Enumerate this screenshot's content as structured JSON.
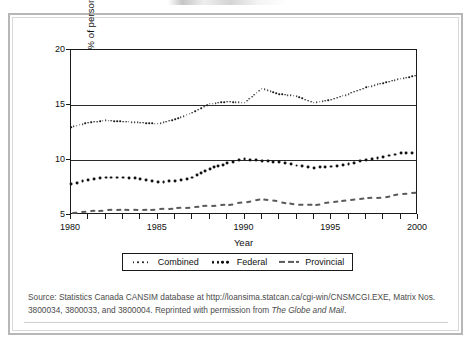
{
  "figure": {
    "source_note_prefix": "Source: Statistics Canada CANSIM database at http://loansima.statcan.ca/cgi-win/CNSMCGI.EXE, Matrix Nos. 3800034, 3800033, and 3800004. Reprinted with permission from ",
    "source_note_italic": "The Globe and Mail",
    "source_note_suffix": "."
  },
  "chart_data": {
    "type": "line",
    "title": "",
    "xlabel": "Year",
    "ylabel": "Income tax as a % of personal income",
    "xlim": [
      1980,
      2000
    ],
    "ylim": [
      5,
      20
    ],
    "yticks": [
      5,
      10,
      15,
      20
    ],
    "ytick_labels": [
      "5",
      "10",
      "15",
      "20"
    ],
    "xticks": [
      1980,
      1981,
      1982,
      1983,
      1984,
      1985,
      1986,
      1987,
      1988,
      1989,
      1990,
      1991,
      1992,
      1993,
      1994,
      1995,
      1996,
      1997,
      1998,
      1999,
      2000
    ],
    "xtick_labels_shown": [
      "1980",
      "1985",
      "1990",
      "1995",
      "2000"
    ],
    "xtick_labels_shown_values": [
      1980,
      1985,
      1990,
      1995,
      2000
    ],
    "gridlines_y": [
      10,
      15,
      20
    ],
    "grid": true,
    "legend_position": "below-axes",
    "x": [
      1980,
      1981,
      1982,
      1983,
      1984,
      1985,
      1986,
      1987,
      1988,
      1989,
      1990,
      1991,
      1992,
      1993,
      1994,
      1995,
      1996,
      1997,
      1998,
      1999,
      2000
    ],
    "series": [
      {
        "name": "Combined",
        "style": "fine-dotted",
        "color": "#1b1b1b",
        "values": [
          13.0,
          13.4,
          13.6,
          13.5,
          13.4,
          13.3,
          13.7,
          14.3,
          15.1,
          15.3,
          15.2,
          16.5,
          16.0,
          15.8,
          15.2,
          15.5,
          16.0,
          16.6,
          17.0,
          17.4,
          17.7
        ]
      },
      {
        "name": "Federal",
        "style": "bold-dotted",
        "color": "#111111",
        "values": [
          7.8,
          8.2,
          8.4,
          8.4,
          8.3,
          8.0,
          8.1,
          8.4,
          9.2,
          9.7,
          10.1,
          9.9,
          9.8,
          9.5,
          9.3,
          9.4,
          9.6,
          10.0,
          10.3,
          10.6,
          10.7
        ]
      },
      {
        "name": "Provincial",
        "style": "dashed",
        "color": "#5a5a5a",
        "values": [
          5.2,
          5.3,
          5.4,
          5.5,
          5.4,
          5.5,
          5.6,
          5.7,
          5.8,
          5.9,
          6.1,
          6.4,
          6.2,
          5.9,
          5.9,
          6.1,
          6.3,
          6.5,
          6.6,
          6.9,
          7.0
        ]
      }
    ]
  }
}
